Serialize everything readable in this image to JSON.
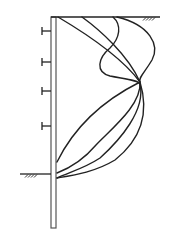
{
  "diagram": {
    "type": "retaining-wall-deflection",
    "colors": {
      "background": "#ffffff",
      "line": "#222222",
      "wall": "#555555"
    },
    "wall": {
      "x_left": 51,
      "x_right": 56,
      "y_top": 17,
      "y_bottom": 228
    },
    "top_ground": {
      "x1": 51,
      "x2": 160,
      "y": 17,
      "hatch_x": 143
    },
    "excavation_ground": {
      "x1": 20,
      "x2": 51,
      "y": 174,
      "hatch_x": 25
    },
    "struts": [
      {
        "y": 31
      },
      {
        "y": 62
      },
      {
        "y": 91
      },
      {
        "y": 126
      }
    ],
    "curves": [
      {
        "name": "curve-1",
        "d": "M58,17 C80,30 120,55 140,82 C120,92 80,115 57,162"
      },
      {
        "name": "curve-2",
        "d": "M82,17 C100,30 128,55 140,82 C142,105 110,130 96,145 C85,158 70,168 57,173"
      },
      {
        "name": "curve-3",
        "d": "M113,17 C122,25 120,38 110,48 C98,58 95,72 110,76 C125,79 138,80 140,84 C146,110 120,140 100,158 C85,168 70,172 57,178"
      },
      {
        "name": "curve-4",
        "d": "M117,17 C150,25 160,45 152,60 C145,72 138,78 140,82 C150,115 140,140 115,160 C95,172 75,175 57,178"
      }
    ]
  }
}
